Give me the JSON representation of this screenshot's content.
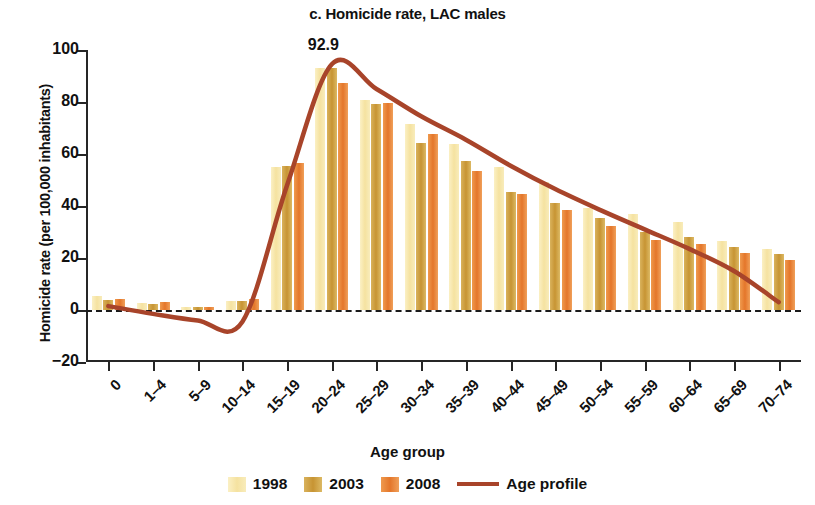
{
  "chart_data": {
    "type": "bar",
    "title": "c. Homicide rate, LAC males",
    "xlabel": "Age group",
    "ylabel": "Homicide rate (per 100,000 inhabitants)",
    "ylim": [
      -20,
      100
    ],
    "yticks": [
      -20,
      0,
      20,
      40,
      60,
      80,
      100
    ],
    "ytick_labels": [
      "-20",
      "0",
      "20",
      "40",
      "60",
      "80",
      "100"
    ],
    "grid": false,
    "legend_position": "bottom",
    "categories": [
      "0",
      "1–4",
      "5–9",
      "10–14",
      "15–19",
      "20–24",
      "25–29",
      "30–34",
      "35–39",
      "40–44",
      "45–49",
      "50–54",
      "55–59",
      "60–64",
      "65–69",
      "70–74"
    ],
    "series": [
      {
        "name": "1998",
        "color": "#F5E2A0",
        "values": [
          5.3,
          2.6,
          1.0,
          3.6,
          55.0,
          92.9,
          80.9,
          71.5,
          64.0,
          55.0,
          49.3,
          39.2,
          36.8,
          34.0,
          26.5,
          23.3
        ]
      },
      {
        "name": "2003",
        "color": "#C79433",
        "values": [
          4.0,
          2.4,
          1.1,
          3.3,
          55.3,
          92.9,
          79.4,
          64.1,
          57.5,
          45.2,
          41.0,
          35.3,
          29.9,
          28.0,
          24.2,
          21.5
        ]
      },
      {
        "name": "2008",
        "color": "#E4762A",
        "values": [
          4.3,
          3.0,
          1.1,
          4.2,
          56.4,
          87.3,
          79.8,
          67.7,
          53.6,
          44.5,
          38.6,
          32.4,
          27.0,
          25.3,
          22.0,
          19.1
        ]
      }
    ],
    "line_series": {
      "name": "Age profile",
      "color": "#A8442A",
      "values": [
        1.5,
        -1.5,
        -4.0,
        -4.5,
        48.0,
        94.5,
        85.0,
        74.5,
        65.5,
        55.5,
        46.5,
        38.5,
        31.0,
        23.5,
        15.0,
        3.0
      ]
    },
    "annotations": [
      {
        "text": "92.9",
        "category": "20–24",
        "value": 92.9
      }
    ]
  },
  "legend": {
    "items": [
      {
        "label": "1998",
        "type": "swatch",
        "key": "y1998"
      },
      {
        "label": "2003",
        "type": "swatch",
        "key": "y2003"
      },
      {
        "label": "2008",
        "type": "swatch",
        "key": "y2008"
      },
      {
        "label": "Age profile",
        "type": "line",
        "key": "line"
      }
    ]
  }
}
